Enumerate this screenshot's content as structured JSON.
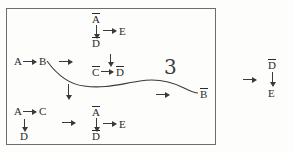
{
  "figure": {
    "background_color": "#fdfdfc",
    "ink_color": "#2b2b2b",
    "frame_color": "#6d6d6d"
  },
  "left_box": {
    "top_group": {
      "top_symbol": "A",
      "top_symbol_overbar": true,
      "bottom_symbol": "D",
      "bottom_symbol_overbar": true,
      "down_arrow": "↓",
      "right_arrow": "→",
      "target_symbol": "E"
    },
    "row_ab": {
      "source": "A",
      "arrow": "→",
      "target": "B",
      "trailing_arrow": "→"
    },
    "middle_group": {
      "down_arrow": "↓",
      "left_symbol": "C",
      "left_symbol_overbar": true,
      "arrow": "→",
      "right_symbol": "D",
      "right_symbol_overbar": true
    },
    "vertical_link_arrow": "↓",
    "row_ac": {
      "source": "A",
      "arrow": "→",
      "target": "C",
      "down_arrow": "↓",
      "below": "D",
      "below_overbar": false,
      "trailing_arrow": "→"
    },
    "bottom_group": {
      "top_symbol": "A",
      "top_symbol_overbar": true,
      "bottom_symbol": "D",
      "bottom_symbol_overbar": true,
      "down_arrow": "↓",
      "right_arrow": "→",
      "target_symbol": "E"
    },
    "curve_label": "3",
    "curve_arrow": "→",
    "curve_endpoint": {
      "symbol": "B",
      "overbar": true
    }
  },
  "right_group": {
    "entry_arrow": "→",
    "top_symbol": "D",
    "top_symbol_overbar": true,
    "down_arrow": "↓",
    "bottom_symbol": "E",
    "bottom_symbol_overbar": false
  }
}
